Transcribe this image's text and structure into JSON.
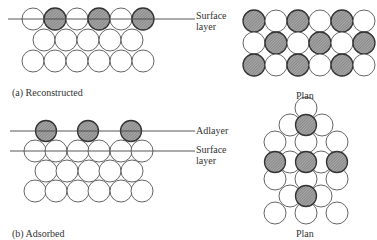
{
  "panel_a": {
    "caption": "(a) Reconstructed",
    "surface_label_1": "Surface",
    "surface_label_2": "layer",
    "plan_caption": "Plan",
    "side_rows": [
      {
        "y": 19,
        "xs": [
          33,
          55,
          77,
          99,
          121,
          143
        ],
        "shaded": [
          1,
          3,
          5
        ]
      },
      {
        "y": 40,
        "xs": [
          44,
          66,
          88,
          110,
          132
        ],
        "shaded": []
      },
      {
        "y": 61,
        "xs": [
          33,
          55,
          77,
          99,
          121,
          143
        ],
        "shaded": []
      }
    ],
    "plan_rows": [
      {
        "y": 21,
        "xs": [
          254,
          276,
          298,
          320,
          342,
          364
        ],
        "shaded": [
          0,
          2,
          4
        ]
      },
      {
        "y": 43,
        "xs": [
          254,
          276,
          298,
          320,
          342,
          364
        ],
        "shaded": [
          1,
          3,
          5
        ]
      },
      {
        "y": 65,
        "xs": [
          254,
          276,
          298,
          320,
          342,
          364
        ],
        "shaded": [
          0,
          2,
          4
        ]
      }
    ]
  },
  "panel_b": {
    "caption": "(b) Adsorbed",
    "adlayer_label": "Adlayer",
    "surface_label_1": "Surface",
    "surface_label_2": "layer",
    "plan_caption": "Plan",
    "adatoms": {
      "y": 131,
      "xs": [
        46,
        88,
        131
      ]
    },
    "side_rows": [
      {
        "y": 151,
        "xs": [
          35,
          56,
          78,
          99,
          121,
          142
        ]
      },
      {
        "y": 171,
        "xs": [
          46,
          67,
          89,
          110,
          132
        ]
      },
      {
        "y": 191,
        "xs": [
          35,
          56,
          78,
          99,
          121,
          142
        ]
      }
    ],
    "plan_white": [
      [
        306,
        108
      ],
      [
        290,
        125
      ],
      [
        322,
        125
      ],
      [
        275,
        142
      ],
      [
        306,
        142
      ],
      [
        337,
        142
      ],
      [
        290,
        162
      ],
      [
        321,
        162
      ],
      [
        275,
        179
      ],
      [
        306,
        179
      ],
      [
        337,
        179
      ],
      [
        290,
        196
      ],
      [
        321,
        196
      ],
      [
        275,
        213
      ],
      [
        306,
        213
      ],
      [
        337,
        213
      ]
    ],
    "plan_shaded": [
      [
        306,
        125
      ],
      [
        275,
        162
      ],
      [
        306,
        162
      ],
      [
        337,
        162
      ],
      [
        306,
        196
      ]
    ]
  }
}
